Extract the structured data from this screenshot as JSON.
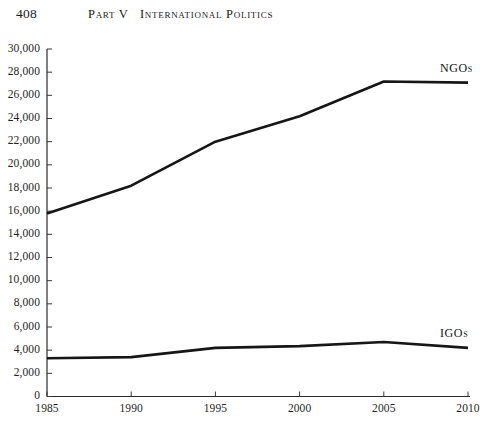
{
  "page": {
    "folio": "408",
    "part": "Part V",
    "section_title": "International Politics"
  },
  "chart_data": {
    "type": "line",
    "title": "",
    "xlabel": "",
    "ylabel": "",
    "x": [
      1985,
      1990,
      1995,
      2000,
      2005,
      2010
    ],
    "xtick_labels": [
      "1985",
      "1990",
      "1995",
      "2000",
      "2005",
      "2010"
    ],
    "xlim": [
      1985,
      2010
    ],
    "ylim": [
      0,
      30000
    ],
    "ytick_labels": [
      "30,000",
      "28,000",
      "26,000",
      "24,000",
      "22,000",
      "20,000",
      "18,000",
      "16,000",
      "14,000",
      "12,000",
      "10,000",
      "8,000",
      "6,000",
      "4,000",
      "2,000",
      "0"
    ],
    "ytick_values": [
      30000,
      28000,
      26000,
      24000,
      22000,
      20000,
      18000,
      16000,
      14000,
      12000,
      10000,
      8000,
      6000,
      4000,
      2000,
      0
    ],
    "grid": false,
    "legend_position": "inline-right",
    "series": [
      {
        "name": "NGOs",
        "label": "NGOs",
        "color": "#161616",
        "values": [
          15800,
          18200,
          22000,
          24200,
          27200,
          27100
        ]
      },
      {
        "name": "IGOs",
        "label": "IGOs",
        "color": "#161616",
        "values": [
          3300,
          3400,
          4200,
          4350,
          4700,
          4200
        ]
      }
    ]
  }
}
